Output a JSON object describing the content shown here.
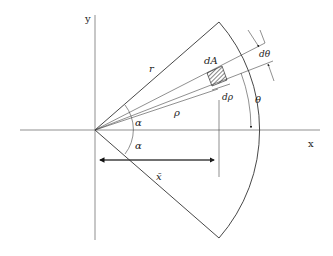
{
  "diagram": {
    "axes": {
      "x_label": "x",
      "y_label": "y"
    },
    "labels": {
      "radius": "r",
      "element_area": "dA",
      "d_theta": "dθ",
      "d_rho": "dρ",
      "rho": "ρ",
      "theta": "θ",
      "alpha_upper": "α",
      "alpha_lower": "α",
      "x_bar": "x̄"
    },
    "colors": {
      "line": "#333333",
      "background": "#ffffff"
    }
  }
}
